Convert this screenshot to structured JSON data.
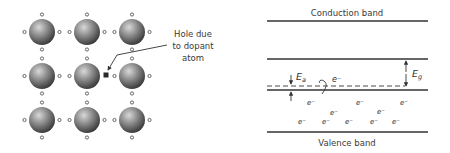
{
  "lattice": {
    "rows": 3,
    "cols": 3,
    "hole_label_lines": [
      "Hole due",
      "to dopant",
      "atom"
    ],
    "atom_color": "#777777",
    "bond_electron": "small-open-circle",
    "hole_marker": "filled-square"
  },
  "band_diagram": {
    "conduction_label": "Conduction band",
    "valence_label": "Valence band",
    "ea_label": "E",
    "ea_sub": "a",
    "eg_label": "E",
    "eg_sub": "g",
    "electron_label": "e⁻",
    "free_electron_label": "e⁻",
    "valence_electron_count": 10
  }
}
